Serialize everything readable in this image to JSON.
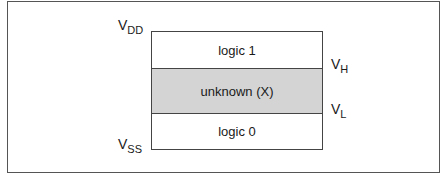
{
  "diagram": {
    "type": "logic-level-voltage-ranges",
    "regions": [
      {
        "label": "logic 1",
        "fill": "#ffffff"
      },
      {
        "label": "unknown (X)",
        "fill": "#d4d4d4"
      },
      {
        "label": "logic 0",
        "fill": "#ffffff"
      }
    ],
    "voltage_labels": {
      "vdd": {
        "main": "V",
        "sub": "DD"
      },
      "vh": {
        "main": "V",
        "sub": "H"
      },
      "vl": {
        "main": "V",
        "sub": "L"
      },
      "vss": {
        "main": "V",
        "sub": "SS"
      }
    }
  }
}
